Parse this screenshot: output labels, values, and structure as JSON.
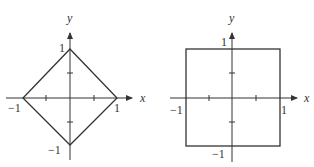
{
  "figures": [
    {
      "name": "diamond",
      "shape": "|x| + |y| = 1",
      "axis_x_label": "x",
      "axis_y_label": "y",
      "tick_labels": {
        "x_neg": "−1",
        "x_pos": "1",
        "y_pos": "1",
        "y_neg": "−1"
      }
    },
    {
      "name": "square",
      "shape": "max(|x|,|y|) = 1",
      "axis_x_label": "x",
      "axis_y_label": "y",
      "tick_labels": {
        "x_neg": "−1",
        "x_pos": "1",
        "y_pos": "1",
        "y_neg": "−1"
      }
    }
  ],
  "colors": {
    "stroke": "#333333",
    "background": "#ffffff"
  }
}
